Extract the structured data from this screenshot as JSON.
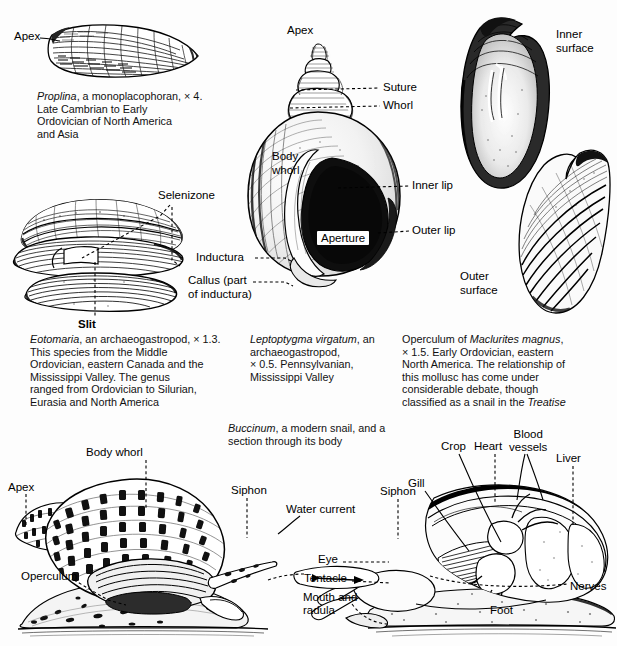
{
  "figure": {
    "background": "#fdfdfd",
    "ink": "#000000"
  },
  "panels": {
    "proplina": {
      "labels": {
        "apex": "Apex"
      },
      "caption_lines": [
        "Proplina, a monoplacophoran, × 4.",
        "Late Cambrian to Early",
        "Ordovician of North America",
        "and Asia"
      ],
      "caption_italic": "Proplina"
    },
    "eotomaria": {
      "labels": {
        "selenizone": "Selenizone",
        "slit": "Slit"
      },
      "caption_lines": [
        "Eotomaria, an archaeogastropod, × 1.3.",
        "This species from the Middle",
        "Ordovician, eastern Canada and the",
        "Mississippi Valley. The genus",
        "ranged from Ordovician to Silurian,",
        "Eurasia and North America"
      ],
      "caption_italic": "Eotomaria"
    },
    "leptoptygma": {
      "labels": {
        "apex": "Apex",
        "suture": "Suture",
        "whorl": "Whorl",
        "body_whorl_line1": "Body",
        "body_whorl_line2": "whorl",
        "inner_lip": "Inner lip",
        "outer_lip": "Outer lip",
        "aperture": "Aperture",
        "inductura": "Inductura",
        "callus_line1": "Callus (part",
        "callus_line2": "of inductura)"
      },
      "caption_lines": [
        "Leptoptygma virgatum, an",
        "archaeogastropod,",
        "× 0.5. Pennsylvanian,",
        "Mississippi Valley"
      ],
      "caption_italic": "Leptoptygma virgatum"
    },
    "maclurites": {
      "labels": {
        "inner_surface_line1": "Inner",
        "inner_surface_line2": "surface",
        "outer_surface_line1": "Outer",
        "outer_surface_line2": "surface"
      },
      "caption_lines": [
        "Operculum of Maclurites magnus,",
        "× 1.5. Early Ordovician, eastern",
        "North America. The relationship of",
        "this mollusc has come under",
        "considerable debate, though",
        "classified as a snail in the Treatise"
      ],
      "caption_italic_1": "Maclurites magnus",
      "caption_italic_2": "Treatise"
    },
    "buccinum": {
      "caption_lines": [
        "Buccinum, a modern snail, and a",
        "section through its body"
      ],
      "caption_italic": "Buccinum",
      "labels_left": {
        "apex": "Apex",
        "body_whorl": "Body whorl",
        "operculum": "Operculum",
        "siphon": "Siphon"
      },
      "labels_right": {
        "water_current": "Water current",
        "siphon": "Siphon",
        "gill": "Gill",
        "crop": "Crop",
        "heart": "Heart",
        "blood_vessels_line1": "Blood",
        "blood_vessels_line2": "vessels",
        "liver": "Liver",
        "eye": "Eye",
        "tentacle": "Tentacle",
        "mouth_line1": "Mouth and",
        "mouth_line2": "radula",
        "foot": "Foot",
        "nerves": "Nerves"
      }
    }
  }
}
